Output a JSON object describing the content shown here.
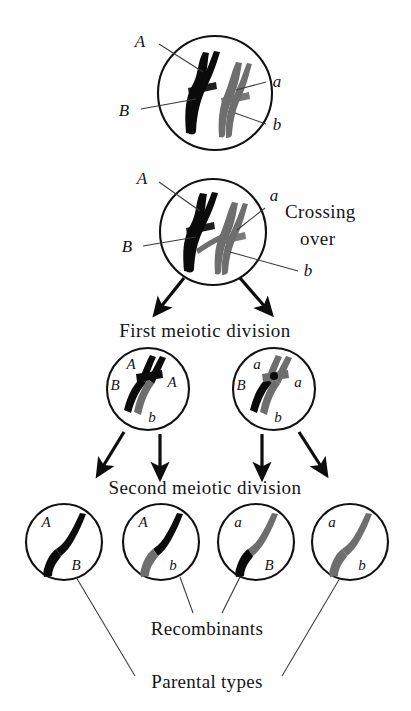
{
  "figure": {
    "background": "#ffffff",
    "colors": {
      "maternal_chromosome": "#0b0b0b",
      "paternal_chromosome": "#6e6e6e",
      "outline": "#111111",
      "leader_line": "#3a3a3a",
      "text": "#161616"
    }
  },
  "stages": {
    "crossing_over_label_line1": "Crossing",
    "crossing_over_label_line2": "over",
    "first_division_label": "First meiotic division",
    "second_division_label": "Second meiotic division"
  },
  "captions": {
    "recombinants": "Recombinants",
    "parental_types": "Parental types"
  },
  "cells": {
    "top": {
      "name": "bivalent-before-crossing-over",
      "labels": {
        "top_left": "A",
        "bottom_left": "B",
        "top_right": "a",
        "bottom_right": "b"
      }
    },
    "crossover": {
      "name": "bivalent-with-chiasma",
      "labels": {
        "top_left": "A",
        "bottom_left": "B",
        "top_right": "a",
        "bottom_right": "b"
      }
    },
    "first_division": [
      {
        "name": "daughter-cell-left",
        "labels": {
          "upper_left": "A",
          "left": "B",
          "right": "A",
          "bottom": "b"
        }
      },
      {
        "name": "daughter-cell-right",
        "labels": {
          "upper_left": "a",
          "left": "B",
          "right": "a",
          "bottom": "b"
        }
      }
    ],
    "gametes": [
      {
        "name": "gamete-AB",
        "top_allele": "A",
        "bottom_allele": "B",
        "top_color": "black",
        "bottom_color": "black",
        "type": "parental"
      },
      {
        "name": "gamete-Ab",
        "top_allele": "A",
        "bottom_allele": "b",
        "top_color": "black",
        "bottom_color": "gray",
        "type": "recombinant"
      },
      {
        "name": "gamete-aB",
        "top_allele": "a",
        "bottom_allele": "B",
        "top_color": "gray",
        "bottom_color": "black",
        "type": "recombinant"
      },
      {
        "name": "gamete-ab",
        "top_allele": "a",
        "bottom_allele": "b",
        "top_color": "gray",
        "bottom_color": "gray",
        "type": "parental"
      }
    ]
  }
}
